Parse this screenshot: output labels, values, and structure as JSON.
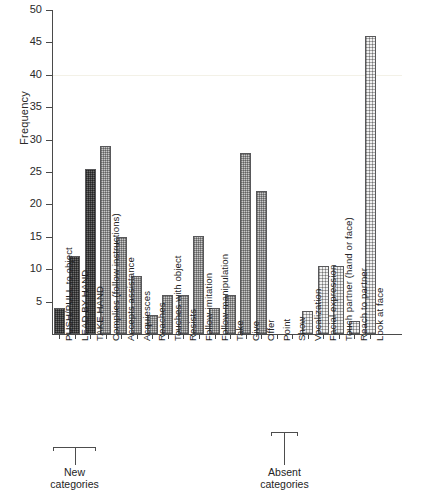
{
  "axes": {
    "ylabel": "Frequency",
    "yticks": [
      "0",
      "5",
      "10",
      "15",
      "20",
      "25",
      "30",
      "35",
      "40",
      "45",
      "50"
    ]
  },
  "annotations": {
    "new_categories": "New\ncategories",
    "new_categories_line1": "New",
    "new_categories_line2": "categories",
    "absent_categories_line1": "Absent",
    "absent_categories_line2": "categories"
  },
  "chart_data": {
    "type": "bar",
    "title": "",
    "xlabel": "",
    "ylabel": "Frequency",
    "ylim": [
      0,
      50
    ],
    "ytick_step": 5,
    "grid": false,
    "legend": null,
    "categories": [
      "PUSH/PULL to object",
      "LEAD BY HAND",
      "TAKE HAND",
      "Complies (follow instructions)",
      "Accepts assistance",
      "Acquiesces",
      "Reaches",
      "Touches with object",
      "Resists",
      "Follow-imitation",
      "Follow-manipulation",
      "Take",
      "Give",
      "Offer",
      "Point",
      "Show",
      "Vocalization",
      "Facial expression",
      "Touch partner (hand or face)",
      "Reach to partner",
      "Look at face"
    ],
    "values": [
      4,
      12,
      25.5,
      29,
      15,
      9,
      3,
      6,
      6,
      15.2,
      4,
      6,
      28,
      22,
      0,
      0,
      3.5,
      10.5,
      10.5,
      2,
      46
    ],
    "fills": [
      "dark",
      "dark",
      "dark",
      "mid",
      "mid",
      "mid",
      "mid",
      "mid",
      "mid",
      "mid",
      "mid",
      "mid",
      "mid",
      "mid",
      "none",
      "none",
      "dot",
      "dot",
      "dot",
      "dot",
      "dot"
    ],
    "groups": [
      {
        "label": "New categories",
        "members": [
          "PUSH/PULL to object",
          "LEAD BY HAND",
          "TAKE HAND"
        ]
      },
      {
        "label": "Absent categories",
        "members": [
          "Point",
          "Show"
        ]
      }
    ]
  }
}
